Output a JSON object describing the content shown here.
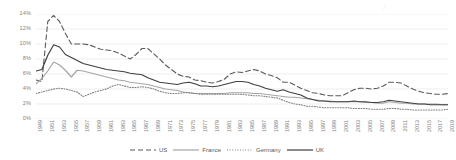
{
  "watermark": "?",
  "legend": {
    "position": "bottom-center",
    "items": [
      {
        "label": "US",
        "style": "dashed",
        "color": "#5a5a5a"
      },
      {
        "label": "France",
        "style": "solid",
        "color": "#a6a6a6"
      },
      {
        "label": "Germany",
        "style": "dotted",
        "color": "#808080"
      },
      {
        "label": "UK",
        "style": "solid",
        "color": "#404040"
      }
    ]
  },
  "chart_data": {
    "type": "line",
    "title": "",
    "subtitle": "",
    "xlabel": "",
    "ylabel": "",
    "grid": true,
    "ylim": [
      0,
      14
    ],
    "xlim": [
      1949,
      2019
    ],
    "yticks": [
      "0%",
      "2%",
      "4%",
      "6%",
      "8%",
      "10%",
      "12%",
      "14%"
    ],
    "ytick_values": [
      0,
      2,
      4,
      6,
      8,
      10,
      12,
      14
    ],
    "x": [
      1949,
      1950,
      1951,
      1952,
      1953,
      1954,
      1955,
      1956,
      1957,
      1958,
      1959,
      1960,
      1961,
      1962,
      1963,
      1964,
      1965,
      1966,
      1967,
      1968,
      1969,
      1970,
      1971,
      1972,
      1973,
      1974,
      1975,
      1976,
      1977,
      1978,
      1979,
      1980,
      1981,
      1982,
      1983,
      1984,
      1985,
      1986,
      1987,
      1988,
      1989,
      1990,
      1991,
      1992,
      1993,
      1994,
      1995,
      1996,
      1997,
      1998,
      1999,
      2000,
      2001,
      2002,
      2003,
      2004,
      2005,
      2006,
      2007,
      2008,
      2009,
      2010,
      2011,
      2012,
      2013,
      2014,
      2015,
      2016,
      2017,
      2018,
      2019
    ],
    "xticks": [
      "1949",
      "1951",
      "1953",
      "1955",
      "1957",
      "1959",
      "1961",
      "1963",
      "1965",
      "1967",
      "1969",
      "1971",
      "1973",
      "1975",
      "1977",
      "1979",
      "1981",
      "1983",
      "1985",
      "1987",
      "1989",
      "1991",
      "1993",
      "1995",
      "1997",
      "1999",
      "2001",
      "2003",
      "2005",
      "2007",
      "2009",
      "2011",
      "2013",
      "2015",
      "2017",
      "2019"
    ],
    "series": [
      {
        "name": "US",
        "style": "dashed",
        "color": "#5a5a5a",
        "values": [
          5.2,
          5.0,
          13.0,
          13.8,
          13.0,
          11.4,
          10.0,
          10.0,
          10.0,
          9.9,
          9.6,
          9.3,
          9.2,
          9.1,
          8.8,
          8.4,
          8.0,
          8.6,
          9.4,
          9.4,
          8.7,
          8.0,
          7.2,
          6.6,
          6.0,
          5.7,
          5.6,
          5.2,
          5.1,
          4.9,
          4.8,
          5.0,
          5.3,
          6.0,
          6.3,
          6.2,
          6.4,
          6.6,
          6.4,
          6.0,
          5.8,
          5.5,
          4.9,
          4.9,
          4.5,
          4.1,
          3.8,
          3.5,
          3.4,
          3.2,
          3.1,
          3.1,
          3.1,
          3.5,
          3.9,
          4.1,
          4.1,
          4.0,
          4.1,
          4.4,
          4.9,
          4.9,
          4.8,
          4.4,
          4.0,
          3.7,
          3.5,
          3.4,
          3.3,
          3.3,
          3.4
        ]
      },
      {
        "name": "France",
        "style": "solid",
        "color": "#a6a6a6",
        "values": [
          4.7,
          5.4,
          6.4,
          7.6,
          7.2,
          6.5,
          5.6,
          6.5,
          6.4,
          6.2,
          6.0,
          5.8,
          5.6,
          5.4,
          5.2,
          5.1,
          4.9,
          4.8,
          4.7,
          4.6,
          4.4,
          4.2,
          4.0,
          3.9,
          3.8,
          3.6,
          3.5,
          3.4,
          3.4,
          3.4,
          3.4,
          3.4,
          3.4,
          3.5,
          3.5,
          3.5,
          3.5,
          3.4,
          3.4,
          3.3,
          3.2,
          3.1,
          3.0,
          2.9,
          2.9,
          2.8,
          2.7,
          2.6,
          2.5,
          2.4,
          2.4,
          2.3,
          2.3,
          2.3,
          2.3,
          2.3,
          2.2,
          2.2,
          2.1,
          2.1,
          2.3,
          2.2,
          2.1,
          2.1,
          2.0,
          2.0,
          2.0,
          2.0,
          2.0,
          1.9,
          1.9
        ]
      },
      {
        "name": "Germany",
        "style": "dotted",
        "color": "#808080",
        "values": [
          3.4,
          3.6,
          3.8,
          4.0,
          4.1,
          4.0,
          3.8,
          3.6,
          3.0,
          3.3,
          3.6,
          3.8,
          4.0,
          4.4,
          4.6,
          4.4,
          4.2,
          4.2,
          4.3,
          4.2,
          4.0,
          3.7,
          3.5,
          3.4,
          3.4,
          3.5,
          3.5,
          3.4,
          3.3,
          3.3,
          3.3,
          3.3,
          3.3,
          3.3,
          3.3,
          3.3,
          3.2,
          3.1,
          3.1,
          3.0,
          2.9,
          2.8,
          2.5,
          2.2,
          2.0,
          1.9,
          1.7,
          1.7,
          1.6,
          1.5,
          1.5,
          1.5,
          1.5,
          1.5,
          1.4,
          1.4,
          1.4,
          1.3,
          1.3,
          1.3,
          1.4,
          1.4,
          1.3,
          1.3,
          1.2,
          1.2,
          1.2,
          1.2,
          1.2,
          1.2,
          1.3
        ]
      },
      {
        "name": "UK",
        "style": "solid",
        "color": "#404040",
        "values": [
          6.4,
          6.6,
          8.5,
          9.9,
          9.6,
          8.6,
          8.2,
          7.8,
          7.4,
          7.2,
          7.0,
          6.8,
          6.6,
          6.5,
          6.4,
          6.3,
          6.1,
          6.0,
          5.9,
          5.5,
          5.2,
          4.9,
          4.8,
          4.7,
          4.6,
          4.8,
          4.9,
          4.7,
          4.4,
          4.4,
          4.3,
          4.4,
          4.6,
          4.8,
          5.0,
          5.0,
          4.9,
          4.6,
          4.4,
          4.1,
          3.9,
          3.7,
          3.9,
          3.6,
          3.4,
          3.2,
          2.8,
          2.6,
          2.4,
          2.4,
          2.3,
          2.3,
          2.3,
          2.3,
          2.4,
          2.3,
          2.3,
          2.2,
          2.2,
          2.3,
          2.5,
          2.4,
          2.3,
          2.2,
          2.1,
          2.0,
          2.0,
          1.9,
          1.9,
          1.9,
          1.9
        ]
      }
    ]
  }
}
